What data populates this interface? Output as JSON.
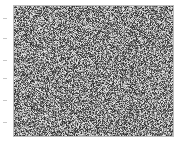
{
  "image": {
    "description": "grayscale random noise texture",
    "colors": {
      "background": "#ffffff",
      "frame": "#bdbdbd",
      "tick": "#c8c8c8"
    },
    "noise": {
      "min_gray": 40,
      "max_gray": 235,
      "seed": 12345
    },
    "tick_positions_y": [
      18,
      38,
      60,
      78,
      100,
      122
    ]
  }
}
